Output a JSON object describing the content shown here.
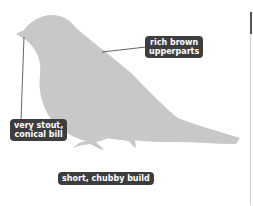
{
  "labels": {
    "upperparts": "rich brown upperparts",
    "upperparts_l1": "rich brown",
    "upperparts_l2": "upperparts",
    "bill_l1": "very stout,",
    "bill_l2": "conical bill",
    "build": "short, chubby build"
  },
  "colors": {
    "silhouette": "#c8c8c8",
    "label_bg": "#3d3d3d",
    "label_text": "#ffffff",
    "leader_line": "#3d3d3d"
  }
}
